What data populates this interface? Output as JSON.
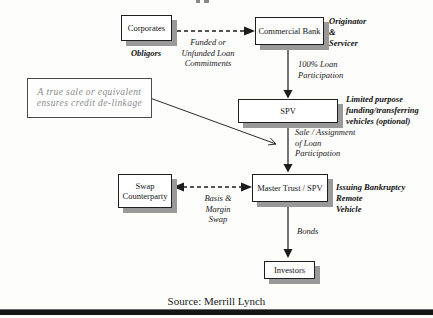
{
  "boxes": {
    "corporates": {
      "label": "Corporates"
    },
    "commercial_bank": {
      "label": "Commercial Bank"
    },
    "spv": {
      "label": "SPV"
    },
    "master_trust": {
      "label": "Master Trust / SPV"
    },
    "swap_counterparty": {
      "label": "Swap\nCounterparty"
    },
    "investors": {
      "label": "Investors"
    }
  },
  "annotations": {
    "obligors": "Obligors",
    "originator_servicer": "Originator\n&\nServicer",
    "limited_purpose": "Limited purpose\nfunding/transferring\nvehicles (optional)",
    "issuing_remote": "Issuing Bankruptcy Remote\nVehicle"
  },
  "flow_labels": {
    "funded_unfunded": "Funded or\nUnfunded Loan\nCommitments",
    "loan_participation": "100% Loan\nParticipation",
    "sale_assignment": "Sale / Assignment\nof Loan\nParticipation",
    "basis_margin": "Basis &\nMargin\nSwap",
    "bonds": "Bonds"
  },
  "callout": {
    "text": "A true sale or equivalent\nensures credit de-linkage"
  },
  "source_note": "Source: Merrill Lynch",
  "colors": {
    "ink": "#1c1c1c",
    "box_shadow": "#999999",
    "callout_text": "#8b8b8b",
    "bottom_bar": "#161616"
  }
}
